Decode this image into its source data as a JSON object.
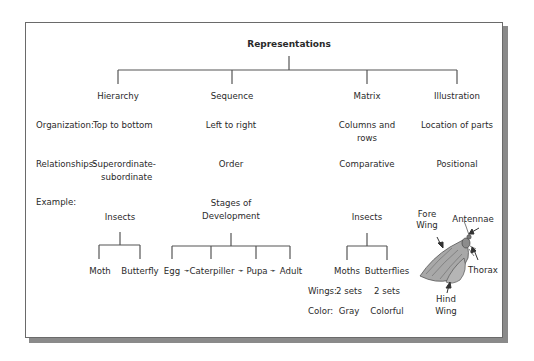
{
  "title": "Representations",
  "types": [
    {
      "label": "Hierarchy"
    },
    {
      "label": "Sequence"
    },
    {
      "label": "Matrix"
    },
    {
      "label": "Illustration"
    }
  ],
  "rows": {
    "organization": {
      "label": "Organization:",
      "hierarchy": "Top to bottom",
      "sequence": "Left to right",
      "matrix_line1": "Columns and",
      "matrix_line2": "rows",
      "illustration": "Location of parts"
    },
    "relationships": {
      "label": "Relationships:",
      "hierarchy_line1": "Superordinate-",
      "hierarchy_line2": "subordinate",
      "sequence": "Order",
      "matrix": "Comparative",
      "illustration": "Positional"
    },
    "example": {
      "label": "Example:"
    }
  },
  "examples": {
    "hierarchy": {
      "root": "Insects",
      "children": [
        "Moth",
        "Butterfly"
      ]
    },
    "sequence": {
      "root_line1": "Stages of",
      "root_line2": "Development",
      "steps": [
        "Egg",
        "Caterpiller",
        "Pupa",
        "Adult"
      ],
      "arrow": "➛"
    },
    "matrix": {
      "root": "Insects",
      "columns": [
        "Moths",
        "Butterflies"
      ],
      "rows": [
        {
          "label": "Wings:",
          "values": [
            "2 sets",
            "2 sets"
          ]
        },
        {
          "label": "Color:",
          "values": [
            "Gray",
            "Colorful"
          ]
        }
      ]
    },
    "illustration": {
      "subject": "moth-illustration",
      "labels": {
        "fore_wing_1": "Fore",
        "fore_wing_2": "Wing",
        "antennae": "Antennae",
        "thorax": "Thorax",
        "hind_wing_1": "Hind",
        "hind_wing_2": "Wing"
      }
    }
  }
}
